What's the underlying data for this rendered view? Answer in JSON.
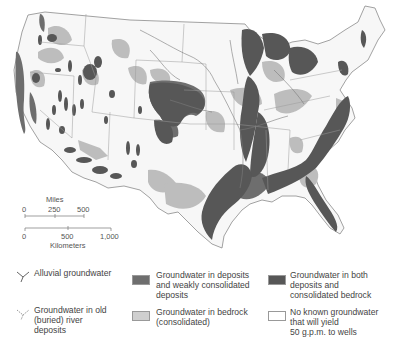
{
  "map": {
    "subject": "Groundwater availability in the contiguous United States",
    "colors": {
      "background": "#ffffff",
      "land": "#f7f7f7",
      "boundary": "#8a8a8a",
      "deposits_weak": "#6e6e6e",
      "bedrock": "#bdbdbd",
      "both": "#575757",
      "none": "#f7f7f7",
      "river": "#7a7a7a"
    }
  },
  "scale": {
    "miles_title": "Miles",
    "miles_ticks": [
      "0",
      "250",
      "500"
    ],
    "km_ticks": [
      "0",
      "500",
      "1,000"
    ],
    "km_title": "Kilometers"
  },
  "legend": {
    "items": [
      {
        "id": "alluvial",
        "icon": "alluvial-stream-icon",
        "label": "Alluvial groundwater"
      },
      {
        "id": "buried",
        "icon": "buried-river-icon",
        "label": "Groundwater in old\n(buried) river\ndeposits"
      },
      {
        "id": "deposits",
        "icon": "swatch",
        "color": "#6e6e6e",
        "label": "Groundwater in deposits\nand weakly consolidated\ndeposits"
      },
      {
        "id": "bedrock",
        "icon": "swatch",
        "color": "#bdbdbd",
        "label": "Groundwater in bedrock\n(consolidated)"
      },
      {
        "id": "both",
        "icon": "swatch",
        "color": "#575757",
        "label": "Groundwater in both\ndeposits and\nconsolidated bedrock"
      },
      {
        "id": "none",
        "icon": "swatch",
        "color": "#ffffff",
        "label": "No known groundwater\nthat will yield\n50 g.p.m. to wells"
      }
    ]
  }
}
